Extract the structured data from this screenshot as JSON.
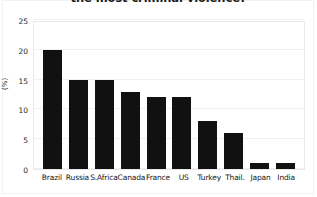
{
  "chart_data": {
    "type": "bar",
    "title": "the most criminal violence?",
    "xlabel": "",
    "ylabel": "(%)",
    "categories": [
      "Brazil",
      "Russia",
      "S.Africa",
      "Canada",
      "France",
      "US",
      "Turkey",
      "Thail.",
      "Japan",
      "India"
    ],
    "values": [
      20,
      15,
      15,
      13,
      12,
      12,
      8,
      6,
      1,
      1
    ],
    "ylim": [
      0,
      25
    ],
    "yticks": [
      0,
      5,
      10,
      15,
      20,
      25
    ],
    "ytick_labels": [
      "0",
      "5",
      "10",
      "15",
      "20",
      "25"
    ],
    "grid": true,
    "legend": false,
    "bar_color": "#111111",
    "background_color": "#ffffff"
  }
}
